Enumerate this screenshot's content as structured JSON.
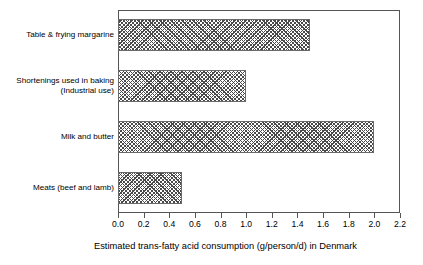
{
  "chart_data": {
    "type": "bar",
    "orientation": "horizontal",
    "title": "",
    "xlabel": "Estimated trans-fatty acid consumption (g/person/d) in Denmark",
    "ylabel": "",
    "categories": [
      "Table & frying margarine",
      "Shortenings used in baking\n(Industrial use)",
      "Milk and butter",
      "Meats (beef and lamb)"
    ],
    "values": [
      1.5,
      1.0,
      2.0,
      0.5
    ],
    "xlim": [
      0.0,
      2.2
    ],
    "xticks": [
      0.0,
      0.2,
      0.4,
      0.6,
      0.8,
      1.0,
      1.2,
      1.4,
      1.6,
      1.8,
      2.0,
      2.2
    ],
    "xticklabels": [
      "0.0",
      "0.2",
      "0.4",
      "0.6",
      "0.8",
      "1.0",
      "1.2",
      "1.4",
      "1.6",
      "1.8",
      "2.0",
      "2.2"
    ],
    "grid": false,
    "legend": false,
    "bar_fill": "crosshatch",
    "bar_fill_color": "#4a4a4a",
    "bar_edge_color": "#6a6a6a",
    "frame_color": "#555555",
    "background": "#ffffff"
  }
}
